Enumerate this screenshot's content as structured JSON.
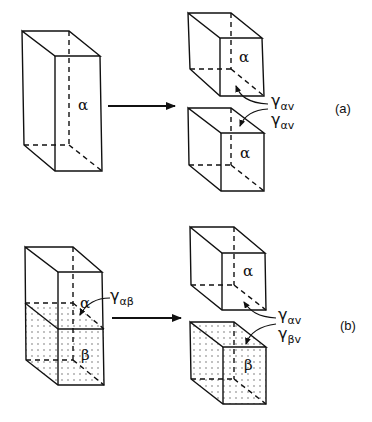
{
  "figure": {
    "panel_a": {
      "label": "(a)",
      "initial_phase": "α",
      "split_phase_top": "α",
      "split_phase_bottom": "α",
      "energy_1": {
        "symbol": "γ",
        "subscript": "αv"
      },
      "energy_2": {
        "symbol": "γ",
        "subscript": "αv"
      }
    },
    "panel_b": {
      "label": "(b)",
      "initial_phase_top": "α",
      "initial_phase_bottom": "β",
      "interface_energy": {
        "symbol": "γ",
        "subscript": "αβ"
      },
      "split_phase_top": "α",
      "split_phase_bottom": "β",
      "energy_1": {
        "symbol": "γ",
        "subscript": "αv"
      },
      "energy_2": {
        "symbol": "γ",
        "subscript": "βv"
      }
    },
    "colors": {
      "line": "#111111",
      "background": "#ffffff",
      "dots": "#555555"
    }
  }
}
